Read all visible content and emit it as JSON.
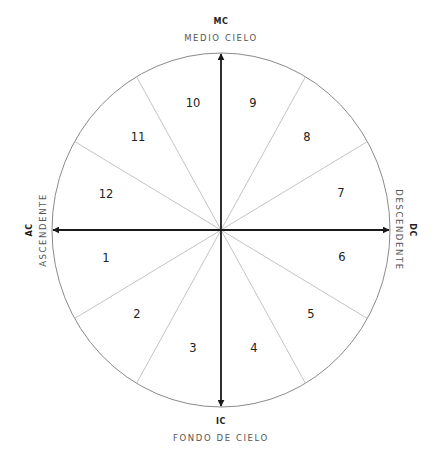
{
  "diagram": {
    "center": {
      "x": 221,
      "y": 230
    },
    "radius": {
      "rx": 169,
      "ry": 177
    },
    "colors": {
      "circle": "#8a8a8a",
      "divider": "#c4c4c4",
      "axis": "#1a1a1a",
      "label_abbr": "#222222",
      "label_name": "#555555",
      "house_number": "#222222"
    },
    "axes": {
      "top": {
        "abbr": "MC",
        "name": "MEDIO CIELO"
      },
      "bottom": {
        "abbr": "IC",
        "name": "FONDO DE CIELO"
      },
      "left": {
        "abbr": "AC",
        "name": "ASCENDENTE"
      },
      "right": {
        "abbr": "DC",
        "name": "DESCENDENTE"
      }
    },
    "houses": [
      {
        "number": "1",
        "x": 106,
        "y": 258
      },
      {
        "number": "2",
        "x": 137,
        "y": 314
      },
      {
        "number": "3",
        "x": 193,
        "y": 348
      },
      {
        "number": "4",
        "x": 254,
        "y": 348
      },
      {
        "number": "5",
        "x": 311,
        "y": 314
      },
      {
        "number": "6",
        "x": 342,
        "y": 257
      },
      {
        "number": "7",
        "x": 341,
        "y": 193
      },
      {
        "number": "8",
        "x": 307,
        "y": 137
      },
      {
        "number": "9",
        "x": 253,
        "y": 103
      },
      {
        "number": "10",
        "x": 193,
        "y": 103
      },
      {
        "number": "11",
        "x": 138,
        "y": 137
      },
      {
        "number": "12",
        "x": 106,
        "y": 194
      }
    ]
  }
}
